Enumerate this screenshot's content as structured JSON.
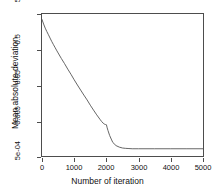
{
  "chart_data": {
    "type": "line",
    "title": "",
    "xlabel": "Number of iteration",
    "ylabel": "Mean absolute deviation",
    "yscale": "log",
    "xlim": [
      0,
      5000
    ],
    "ylim": [
      0.0005,
      5
    ],
    "grid": false,
    "legend": null,
    "xticks": [
      0,
      1000,
      2000,
      3000,
      4000,
      5000
    ],
    "xticklabels": [
      "0",
      "1000",
      "2000",
      "3000",
      "4000",
      "5000"
    ],
    "yticks": [
      5,
      0.5,
      0.05,
      0.005,
      0.0005
    ],
    "yticklabels": [
      "5",
      "0.5",
      "0.05",
      "0.005",
      "5e-04"
    ],
    "line_color": "#555555",
    "series": [
      {
        "name": "mean absolute deviation",
        "x": [
          0,
          50,
          100,
          150,
          200,
          250,
          300,
          350,
          400,
          450,
          500,
          600,
          700,
          800,
          900,
          1000,
          1100,
          1200,
          1300,
          1400,
          1500,
          1600,
          1700,
          1800,
          1850,
          1900,
          1950,
          1975,
          2000,
          2025,
          2050,
          2100,
          2150,
          2200,
          2300,
          2400,
          2500,
          2600,
          2700,
          2800,
          3000,
          3500,
          4000,
          4500,
          5000
        ],
        "values": [
          3.5,
          2.6,
          2.0,
          1.6,
          1.3,
          1.05,
          0.85,
          0.7,
          0.58,
          0.48,
          0.4,
          0.28,
          0.2,
          0.14,
          0.1,
          0.07,
          0.05,
          0.036,
          0.026,
          0.019,
          0.0135,
          0.0098,
          0.0072,
          0.0054,
          0.0047,
          0.0042,
          0.0039,
          0.00385,
          0.0038,
          0.0031,
          0.0026,
          0.0019,
          0.0015,
          0.0012,
          0.00098,
          0.00089,
          0.00084,
          0.00082,
          0.00081,
          0.0008,
          0.0008,
          0.0008,
          0.0008,
          0.0008,
          0.0008
        ]
      }
    ]
  },
  "axis": {
    "y_tick_labels": [
      "5",
      "0.5",
      "0.05",
      "0.005",
      "5e-04"
    ],
    "x_tick_labels": [
      "0",
      "1000",
      "2000",
      "3000",
      "4000",
      "5000"
    ],
    "x_title": "Number of iteration",
    "y_title": "Mean absolute deviation"
  }
}
